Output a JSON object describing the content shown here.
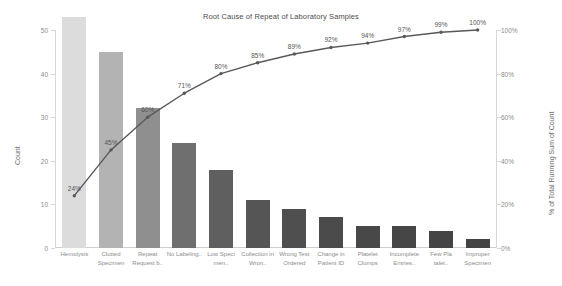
{
  "chart_data": {
    "type": "bar",
    "title": "Root Cause of Repeat of Laboratory Samples",
    "xlabel": "",
    "ylabel": "Count",
    "y2label": "% of Total Running Sum of Count",
    "ylim": [
      0,
      50
    ],
    "y2lim": [
      0,
      100
    ],
    "grid": false,
    "legend": null,
    "categories": [
      "Hemolysis",
      "Clotted Specimen",
      "Repeat Request b..",
      "No Labeling..",
      "Low Speci men..",
      "Collection in Wron..",
      "Wrong Test Ordered",
      "Change in Patient ID",
      "Platelet Clumps",
      "Incomplete Entries..",
      "Few Pla talet..",
      "Improper Specimen"
    ],
    "series": [
      {
        "name": "Count",
        "type": "bar",
        "axis": "left",
        "values": [
          53,
          45,
          32,
          24,
          18,
          11,
          9,
          7,
          5,
          5,
          4,
          2
        ]
      },
      {
        "name": "% of Total Running Sum of Count",
        "type": "line",
        "axis": "right",
        "values": [
          24,
          45,
          60,
          71,
          80,
          85,
          89,
          92,
          94,
          97,
          99,
          100
        ],
        "labels": [
          "24%",
          "45%",
          "60%",
          "71%",
          "80%",
          "85%",
          "89%",
          "92%",
          "94%",
          "97%",
          "99%",
          "100%"
        ]
      }
    ],
    "bar_colors": [
      "#dcdcdc",
      "#b3b3b3",
      "#8f8f8f",
      "#6f6f6f",
      "#5f5f5f",
      "#555555",
      "#4f4f4f",
      "#4b4b4b",
      "#484848",
      "#464646",
      "#444444",
      "#434343"
    ],
    "line_color": "#595959",
    "yticks_left": [
      "0",
      "10",
      "20",
      "30",
      "40",
      "50"
    ],
    "yticks_left_values": [
      0,
      10,
      20,
      30,
      40,
      50
    ],
    "yticks_right": [
      "0%",
      "20%",
      "40%",
      "60%",
      "80%",
      "100%"
    ],
    "yticks_right_values": [
      0,
      20,
      40,
      60,
      80,
      100
    ]
  }
}
